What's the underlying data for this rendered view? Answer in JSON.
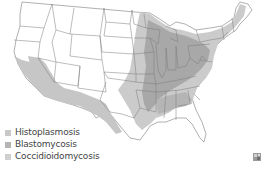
{
  "map": {
    "subject": "United States",
    "regions": [
      {
        "name": "Histoplasmosis",
        "color": "#c8c8c8"
      },
      {
        "name": "Blastomycosis",
        "color": "#a9a9a9"
      },
      {
        "name": "Coccidioidomycosis",
        "color": "#bdbdbd"
      }
    ]
  },
  "legend": {
    "items": [
      {
        "label": "Histoplasmosis",
        "color": "#c8c8c8"
      },
      {
        "label": "Blastomycosis",
        "color": "#b4b4b4"
      },
      {
        "label": "Coccidioidomycosis",
        "color": "#cfcfcf"
      }
    ]
  },
  "corner_icon": {
    "name": "expand-map-icon"
  }
}
